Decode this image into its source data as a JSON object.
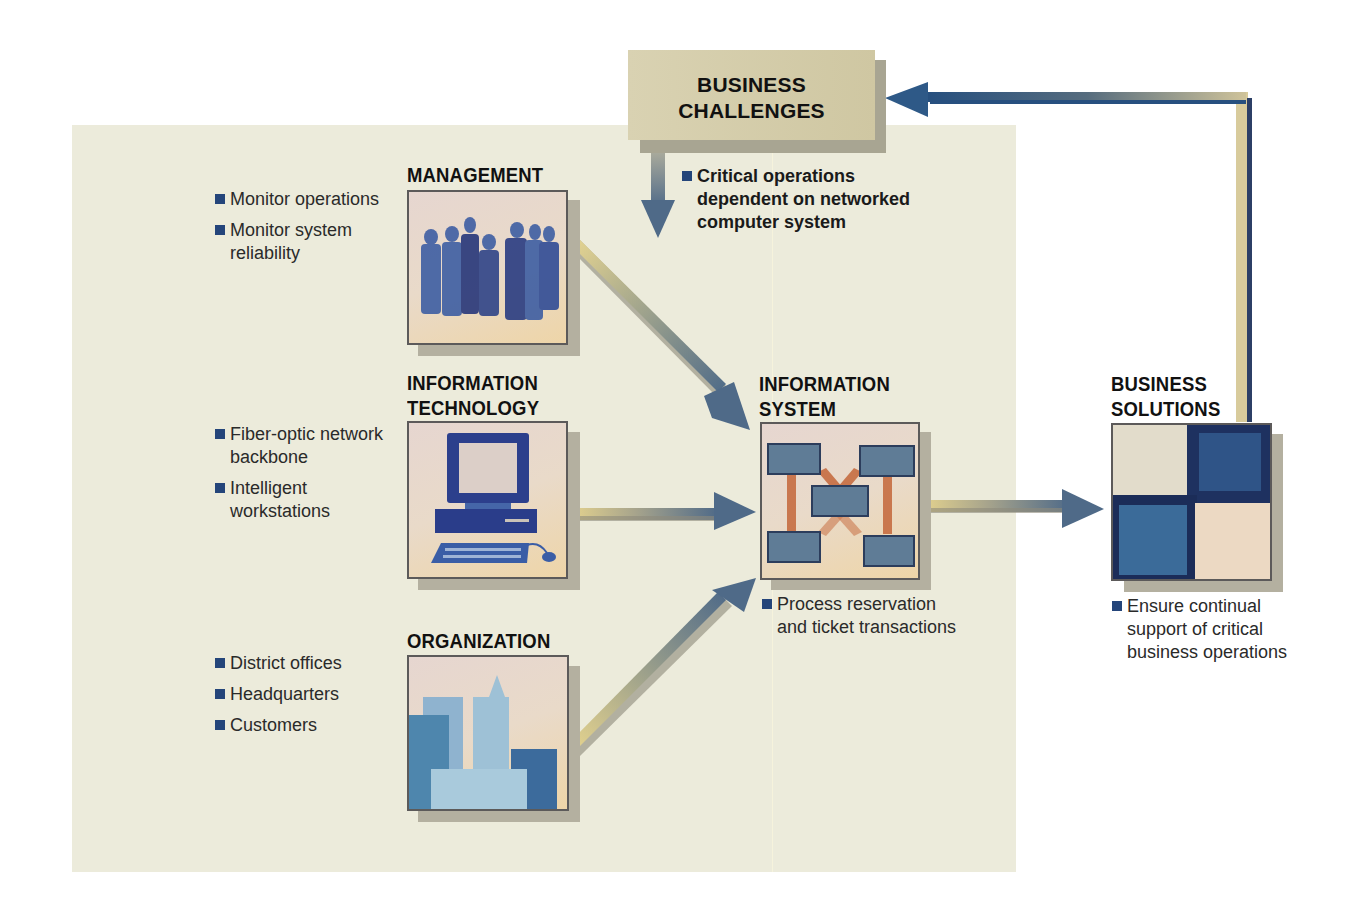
{
  "diagram": {
    "business_challenges": {
      "title_line1": "BUSINESS",
      "title_line2": "CHALLENGES",
      "bullets": [
        "Critical operations",
        "dependent on networked",
        "computer system"
      ]
    },
    "management": {
      "title": "MANAGEMENT",
      "bullets": [
        {
          "line1": "Monitor operations",
          "line2": ""
        },
        {
          "line1": "Monitor system",
          "line2": "reliability"
        }
      ]
    },
    "information_technology": {
      "title_line1": "INFORMATION",
      "title_line2": "TECHNOLOGY",
      "bullets": [
        {
          "line1": "Fiber-optic network",
          "line2": "backbone"
        },
        {
          "line1": "Intelligent",
          "line2": "workstations"
        }
      ]
    },
    "organization": {
      "title": "ORGANIZATION",
      "bullets": [
        "District offices",
        "Headquarters",
        "Customers"
      ]
    },
    "information_system": {
      "title_line1": "INFORMATION",
      "title_line2": "SYSTEM",
      "bullets": [
        {
          "line1": "Process reservation",
          "line2": "and ticket transactions"
        }
      ]
    },
    "business_solutions": {
      "title_line1": "BUSINESS",
      "title_line2": "SOLUTIONS",
      "bullets": [
        {
          "line1": "Ensure continual",
          "line2": "support of critical",
          "line3": "business operations"
        }
      ]
    },
    "icons": {
      "management": "people-silhouettes-icon",
      "information_technology": "desktop-computer-icon",
      "organization": "city-buildings-icon",
      "information_system": "network-nodes-icon",
      "business_solutions": "checkered-squares-icon"
    },
    "colors": {
      "panel_background": "#ecebdb",
      "bullet_square": "#24457a",
      "arrow_start": "#e6d48e",
      "arrow_end": "#4f6a88",
      "feedback_blue": "#27507f",
      "challenge_box": "#d6cfae"
    }
  }
}
